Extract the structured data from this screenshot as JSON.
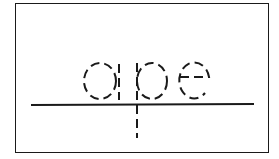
{
  "worksheet": {
    "word": "ape",
    "letters": [
      "a",
      "p",
      "e"
    ],
    "style": "dashed tracing letters on baseline",
    "colors": {
      "ink": "#1a1a1a",
      "background": "#ffffff"
    }
  }
}
